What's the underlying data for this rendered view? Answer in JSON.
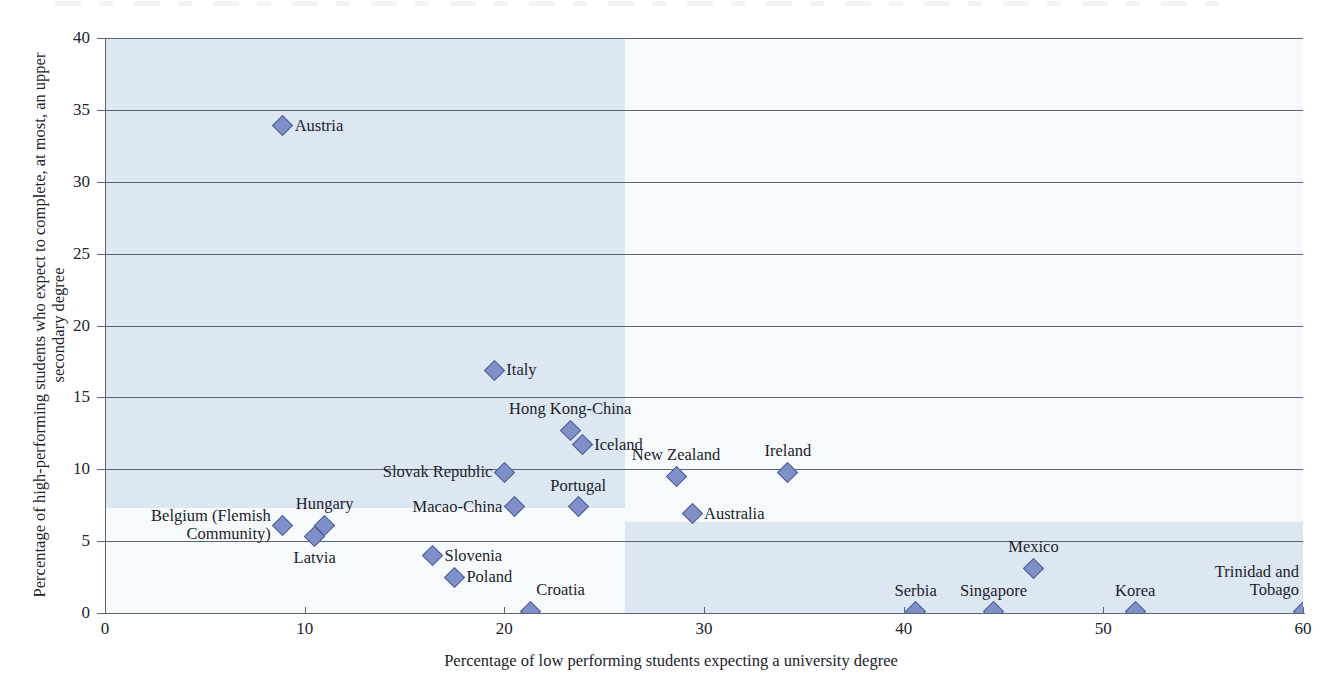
{
  "chart_data": {
    "type": "scatter",
    "title": "",
    "xlabel": "Percentage of low performing students expecting a university degree",
    "ylabel": "Percentage of high-performing students who expect to complete, at most, an upper secondary degree",
    "xlim": [
      0,
      60
    ],
    "ylim": [
      0,
      40
    ],
    "xticks": [
      "0",
      "10",
      "20",
      "30",
      "40",
      "50",
      "60"
    ],
    "xtick_values": [
      0,
      10,
      20,
      30,
      40,
      50,
      60
    ],
    "yticks": [
      "0",
      "5",
      "10",
      "15",
      "20",
      "25",
      "30",
      "35",
      "40"
    ],
    "ytick_values": [
      0,
      5,
      10,
      15,
      20,
      25,
      30,
      35,
      40
    ],
    "grid": "horizontal",
    "legend": "none",
    "marker": "diamond",
    "marker_color": "#7f8fc8",
    "marker_edge_color": "#4c5a93",
    "shading": {
      "vertical_split_x": 26,
      "horizontal_split_y_left": 6.6,
      "horizontal_split_y_right": 6.3,
      "shaded_color": "#dce7f2",
      "unshaded_color": "#f6fafd"
    },
    "points": [
      {
        "name": "Austria",
        "x": 8.9,
        "y": 33.9,
        "label_pos": "right"
      },
      {
        "name": "Italy",
        "x": 19.5,
        "y": 16.9,
        "label_pos": "right"
      },
      {
        "name": "Hong Kong-China",
        "x": 23.3,
        "y": 12.7,
        "label_pos": "above"
      },
      {
        "name": "Iceland",
        "x": 23.9,
        "y": 11.7,
        "label_pos": "right"
      },
      {
        "name": "Slovak Republic",
        "x": 20.0,
        "y": 9.8,
        "label_pos": "left"
      },
      {
        "name": "Ireland",
        "x": 34.2,
        "y": 9.8,
        "label_pos": "above"
      },
      {
        "name": "New Zealand",
        "x": 28.6,
        "y": 9.5,
        "label_pos": "above"
      },
      {
        "name": "Macao-China",
        "x": 20.5,
        "y": 7.4,
        "label_pos": "left"
      },
      {
        "name": "Portugal",
        "x": 23.7,
        "y": 7.4,
        "label_pos": "above"
      },
      {
        "name": "Australia",
        "x": 29.4,
        "y": 6.9,
        "label_pos": "right"
      },
      {
        "name": "Belgium (Flemish\nCommunity)",
        "x": 8.9,
        "y": 6.1,
        "label_pos": "left"
      },
      {
        "name": "Hungary",
        "x": 11.0,
        "y": 6.1,
        "label_pos": "above"
      },
      {
        "name": "Latvia",
        "x": 10.5,
        "y": 5.3,
        "label_pos": "below"
      },
      {
        "name": "Slovenia",
        "x": 16.4,
        "y": 4.0,
        "label_pos": "right"
      },
      {
        "name": "Mexico",
        "x": 46.5,
        "y": 3.1,
        "label_pos": "above"
      },
      {
        "name": "Poland",
        "x": 17.5,
        "y": 2.5,
        "label_pos": "right"
      },
      {
        "name": "Croatia",
        "x": 21.3,
        "y": 0.1,
        "label_pos": "above-right"
      },
      {
        "name": "Serbia",
        "x": 40.6,
        "y": 0.1,
        "label_pos": "above"
      },
      {
        "name": "Singapore",
        "x": 44.5,
        "y": 0.1,
        "label_pos": "above"
      },
      {
        "name": "Korea",
        "x": 51.6,
        "y": 0.1,
        "label_pos": "above"
      },
      {
        "name": "Trinidad and\nTobago",
        "x": 60.0,
        "y": 0.1,
        "label_pos": "above-left"
      }
    ]
  }
}
